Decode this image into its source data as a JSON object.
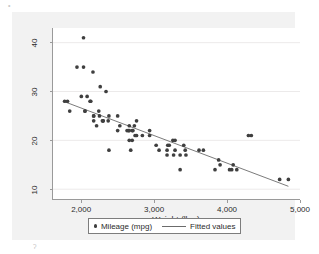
{
  "figure": {
    "background_color": "#f2f2f2",
    "plot_background_color": "#ffffff",
    "marker_color": "#3f3f3f",
    "line_color": "#6b6b6b",
    "axis_color": "#9a9a9a",
    "grid_color": "#eceaea"
  },
  "artifacts": {
    "top_left": "•",
    "bottom_left": "ʔ"
  },
  "legend": {
    "entries": [
      {
        "label": "Mileage (mpg)",
        "marker": "dot-marker"
      },
      {
        "label": "Fitted values",
        "marker": "line-marker"
      }
    ]
  },
  "chart_data": {
    "type": "scatter",
    "title": "",
    "xlabel": "Weight (lbs.)",
    "ylabel": "",
    "xlim": [
      1600,
      5000
    ],
    "ylim": [
      8,
      43
    ],
    "xticks": [
      2000,
      3000,
      4000,
      5000
    ],
    "xticklabels": [
      "2,000",
      "3,000",
      "4,000",
      "5,000"
    ],
    "yticks": [
      10,
      20,
      30,
      40
    ],
    "yticklabels": [
      "10",
      "20",
      "30",
      "40"
    ],
    "grid": "horizontal",
    "legend_position": "bottom",
    "series": [
      {
        "name": "Mileage (mpg)",
        "type": "scatter",
        "marker": "circle",
        "color": "#3f3f3f",
        "x": [
          2930,
          3350,
          2640,
          3250,
          4080,
          3670,
          2230,
          3280,
          3880,
          3400,
          2110,
          3060,
          3610,
          2930,
          4330,
          3900,
          4290,
          4720,
          3430,
          3260,
          2690,
          2620,
          4130,
          2830,
          2070,
          2650,
          2150,
          2120,
          3020,
          3180,
          4060,
          3830,
          4840,
          4030,
          2730,
          2490,
          2290,
          2280,
          3280,
          2750,
          3170,
          2020,
          1800,
          2520,
          2290,
          2160,
          2370,
          3350,
          2020,
          2250,
          2690,
          2700,
          2490,
          3420,
          2720,
          2240,
          2650,
          1760,
          2330,
          2650,
          2750,
          2370,
          3170,
          2200,
          2670,
          1930,
          1990,
          3200,
          2160,
          2040,
          1830,
          2360,
          2160,
          2040
        ],
        "y": [
          22,
          17,
          22,
          20,
          15,
          18,
          26,
          20,
          16,
          19,
          28,
          18,
          18,
          21,
          21,
          15,
          21,
          12,
          17,
          17,
          20,
          22,
          14,
          21,
          29,
          20,
          34,
          28,
          19,
          19,
          14,
          14,
          12,
          14,
          21,
          22,
          24,
          24,
          18,
          24,
          18,
          35,
          28,
          23,
          24,
          25,
          25,
          14,
          41,
          31,
          22,
          22,
          25,
          18,
          23,
          25,
          23,
          28,
          30,
          22,
          21,
          18,
          17,
          23,
          18,
          35,
          29,
          19,
          24,
          26,
          26,
          24,
          25,
          26
        ]
      },
      {
        "name": "Fitted values",
        "type": "line",
        "color": "#6b6b6b",
        "x": [
          1760,
          4840
        ],
        "y": [
          27.9,
          10.6
        ]
      }
    ]
  }
}
